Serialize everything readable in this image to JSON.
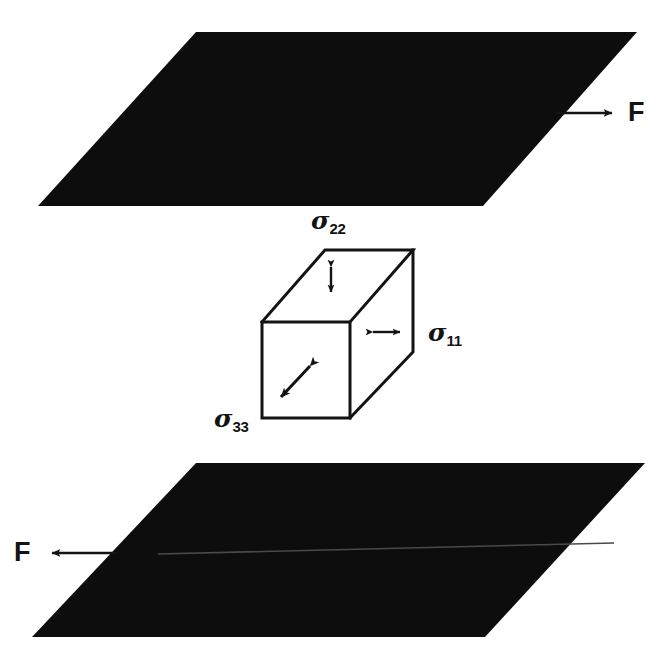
{
  "figure": {
    "type": "engineering-diagram",
    "background_color": "#ffffff",
    "ink_color": "#131313"
  },
  "planes": [
    {
      "name": "top-plate",
      "fill": "#0d0d0d",
      "points": "196,32 637,32 483,206 38,206"
    },
    {
      "name": "bottom-plate",
      "fill": "#0d0d0d",
      "points": "196,463 645,463 485,637 32,637",
      "seam_line": "158,553 613,543"
    }
  ],
  "forces": [
    {
      "name": "top-force",
      "label": "F",
      "direction": "right",
      "tail_x": 558,
      "tail_y": 113,
      "head_x": 614,
      "head_y": 113,
      "label_x": 628,
      "label_y": 99
    },
    {
      "name": "bottom-force",
      "label": "F",
      "direction": "left",
      "tail_x": 116,
      "tail_y": 553,
      "head_x": 47,
      "head_y": 553,
      "label_x": 16,
      "label_y": 539
    }
  ],
  "cube": {
    "name": "stress-element-cube",
    "stroke": "#131313",
    "fill": "#ffffff",
    "front_face": "262,322 350,322 350,418 262,418",
    "top_face": "262,322 325,250 413,250 350,322",
    "right_face": "350,322 413,250 413,352 350,418",
    "stresses": [
      {
        "name": "sigma-22",
        "sigma": "σ",
        "subscript": "22",
        "arrow": "double-headed-vertical",
        "arrow_x": 331,
        "arrow_top_y": 261,
        "arrow_bottom_y": 298,
        "label_x": 311,
        "label_y": 208
      },
      {
        "name": "sigma-11",
        "sigma": "σ",
        "subscript": "11",
        "arrow": "double-headed-horizontal",
        "arrow_y": 332,
        "arrow_left_x": 367,
        "arrow_right_x": 406,
        "label_x": 428,
        "label_y": 320
      },
      {
        "name": "sigma-33",
        "sigma": "σ",
        "subscript": "33",
        "arrow": "double-headed-diagonal",
        "arrow_start_x": 314,
        "arrow_start_y": 362,
        "arrow_end_x": 276,
        "arrow_end_y": 402,
        "label_x": 214,
        "label_y": 412
      }
    ]
  }
}
